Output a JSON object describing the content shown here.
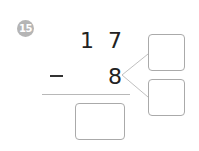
{
  "problem": {
    "number": "15",
    "minuend_tens": "1",
    "minuend_ones": "7",
    "operator": "−",
    "subtrahend": "8",
    "answer_box": "",
    "decompose_box_top": "",
    "decompose_box_bottom": ""
  },
  "colors": {
    "badge": "#b5b5b5",
    "box_border": "#aaaaaa",
    "rule": "#b8b8b8"
  }
}
